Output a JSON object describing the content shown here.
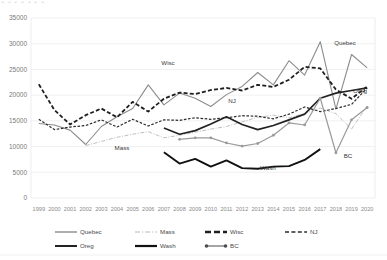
{
  "top_strip": {
    "ghost_text": "⌄                    ⌄           ⌄                 ⌄   ⌄        ⌄                                      ⌄"
  },
  "chart_data": {
    "type": "line",
    "title": "",
    "subtitle": "",
    "xlabel": "",
    "ylabel": "",
    "grid": true,
    "legend_position": "bottom",
    "ylim": [
      0,
      35000
    ],
    "ytick_step": 5000,
    "ytick_labels": [
      "0",
      "5000",
      "10000",
      "15000",
      "20000",
      "25000",
      "30000",
      "35000"
    ],
    "categories": [
      "1999",
      "2000",
      "2001",
      "2002",
      "2003",
      "2004",
      "2005",
      "2006",
      "2007",
      "2008",
      "2009",
      "2010",
      "2011",
      "2012",
      "2013",
      "2014",
      "2015",
      "2016",
      "2017",
      "2018",
      "2019",
      "2020"
    ],
    "series": [
      {
        "name": "Quebec",
        "label_text": "Quebec",
        "style": "solid-gray",
        "color": "#8c8c8c",
        "width": 1.1,
        "dash": "none",
        "marker": "none",
        "label_xy": [
          345,
          45
        ],
        "values": [
          14500,
          14200,
          13200,
          10400,
          13900,
          15800,
          17400,
          22000,
          18100,
          20400,
          19400,
          17800,
          20100,
          21700,
          24400,
          22000,
          26700,
          23900,
          30400,
          17300,
          27900,
          25300
        ]
      },
      {
        "name": "Mass",
        "label_text": "Mass",
        "style": "dash-dot-light",
        "color": "#b8b8b8",
        "width": 0.9,
        "dash": "4,1.5,1,1.5",
        "marker": "none",
        "label_xy": [
          122,
          150
        ],
        "values": [
          null,
          null,
          null,
          10200,
          11000,
          11800,
          12400,
          12900,
          11700,
          12200,
          12800,
          13400,
          13900,
          14800,
          15700,
          16100,
          15600,
          16400,
          17500,
          16400,
          13400,
          17900
        ]
      },
      {
        "name": "Wisc",
        "label_text": "Wisc",
        "style": "dashed-heavy",
        "color": "#1f1f1f",
        "width": 1.8,
        "dash": "4,2.2",
        "marker": "none",
        "label_xy": [
          168,
          65
        ],
        "values": [
          22100,
          17100,
          14300,
          16100,
          17400,
          15700,
          18700,
          16800,
          19300,
          20500,
          20200,
          21000,
          21400,
          20900,
          22000,
          21600,
          23000,
          25500,
          25200,
          21100,
          19300,
          21700
        ]
      },
      {
        "name": "NJ",
        "label_text": "NJ",
        "style": "dashed-fine",
        "color": "#2b2b2b",
        "width": 1.2,
        "dash": "2.6,1.6",
        "marker": "none",
        "label_xy": [
          232,
          103
        ],
        "values": [
          15300,
          13300,
          13800,
          14100,
          15200,
          13800,
          15300,
          14000,
          15200,
          15100,
          15600,
          15300,
          15600,
          16000,
          15900,
          15400,
          16300,
          17700,
          16800,
          17400,
          18200,
          21400
        ]
      },
      {
        "name": "Oreg",
        "label_text": "Oreg",
        "style": "solid-dark",
        "color": "#232323",
        "width": 1.7,
        "dash": "none",
        "marker": "none",
        "label_xy": [
          360,
          93
        ],
        "values": [
          null,
          null,
          null,
          null,
          null,
          null,
          null,
          null,
          13600,
          12400,
          13100,
          14400,
          15800,
          14300,
          13300,
          14100,
          15200,
          16300,
          19400,
          20400,
          20900,
          21400
        ]
      },
      {
        "name": "Wash",
        "label_text": "Wash",
        "style": "solid-black",
        "color": "#111111",
        "width": 1.9,
        "dash": "none",
        "marker": "none",
        "label_xy": [
          268,
          170
        ],
        "values": [
          null,
          null,
          null,
          null,
          null,
          null,
          null,
          null,
          8900,
          6700,
          7600,
          6100,
          7300,
          5800,
          5700,
          6100,
          6200,
          7400,
          9500,
          null,
          null,
          null
        ]
      },
      {
        "name": "BC",
        "label_text": "BC",
        "style": "solid-gray-marker",
        "color": "#9a9a9a",
        "width": 1.2,
        "dash": "none",
        "marker": "circle",
        "label_xy": [
          348,
          158
        ],
        "values": [
          null,
          null,
          null,
          null,
          null,
          null,
          null,
          null,
          null,
          11400,
          11700,
          11700,
          10700,
          10100,
          10600,
          12200,
          14600,
          14200,
          19400,
          8800,
          15200,
          17600
        ]
      }
    ]
  },
  "legend": {
    "row1": [
      {
        "name": "Quebec",
        "label": "Quebec",
        "marker": "solid-gray"
      },
      {
        "name": "Mass",
        "label": "Mass",
        "marker": "dash-dot-light"
      },
      {
        "name": "Wisc",
        "label": "Wisc",
        "marker": "dashed-heavy"
      },
      {
        "name": "NJ",
        "label": "NJ",
        "marker": "dashed-fine"
      }
    ],
    "row2": [
      {
        "name": "Oreg",
        "label": "Oreg",
        "marker": "solid-dark"
      },
      {
        "name": "Wash",
        "label": "Wash",
        "marker": "solid-black"
      },
      {
        "name": "BC",
        "label": "BC",
        "marker": "solid-gray-marker"
      }
    ]
  }
}
